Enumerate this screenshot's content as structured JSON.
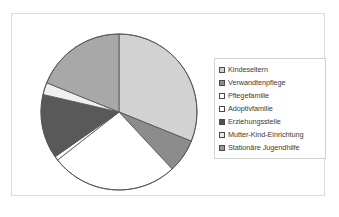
{
  "chart_data": {
    "type": "pie",
    "title": "",
    "legend_position": "right",
    "start_angle_deg": 0,
    "direction": "clockwise",
    "categories": [
      "Kindeseltern",
      "Verwandtenpflege",
      "Pflegefamilie",
      "Adoptivfamilie",
      "Erziehungsstelle",
      "Mutter-Kind-Einrichtung",
      "Stationäre Jugendhilfe"
    ],
    "values": [
      31.1,
      6.9,
      26.4,
      0.8,
      13.3,
      2.5,
      18.9
    ],
    "colors": [
      "#d2d2d2",
      "#8c8c8c",
      "#ffffff",
      "#ffffff",
      "#595959",
      "#f0f0f0",
      "#a8a8a8"
    ],
    "slices": [
      {
        "label": "Kindeseltern",
        "value": 31.1,
        "start_deg": 0.0,
        "end_deg": 112.0,
        "color": "#d2d2d2",
        "swatch": "#d2d2d2"
      },
      {
        "label": "Verwandtenpflege",
        "value": 6.9,
        "start_deg": 112.0,
        "end_deg": 137.0,
        "color": "#8c8c8c",
        "swatch": "#8c8c8c"
      },
      {
        "label": "Pflegefamilie",
        "value": 26.4,
        "start_deg": 137.0,
        "end_deg": 232.0,
        "color": "#ffffff",
        "swatch": "#ffffff"
      },
      {
        "label": "Adoptivfamilie",
        "value": 0.8,
        "start_deg": 232.0,
        "end_deg": 235.0,
        "color": "#ffffff",
        "swatch": "#ffffff"
      },
      {
        "label": "Erziehungsstelle",
        "value": 13.3,
        "start_deg": 235.0,
        "end_deg": 283.0,
        "color": "#595959",
        "swatch": "#4f4f4f"
      },
      {
        "label": "Mutter-Kind-Einrichtung",
        "value": 2.5,
        "start_deg": 283.0,
        "end_deg": 292.0,
        "color": "#f0f0f0",
        "swatch": "#e8e8e8"
      },
      {
        "label": "Stationäre Jugendhilfe",
        "value": 18.9,
        "start_deg": 292.0,
        "end_deg": 360.0,
        "color": "#a8a8a8",
        "swatch": "#9a9a9a"
      }
    ],
    "outline_color": "#555555",
    "frame_color": "#dcdcdc",
    "background": "#ffffff"
  },
  "legend": {
    "items": [
      {
        "label": "Kindeseltern"
      },
      {
        "label": "Verwandtenpflege"
      },
      {
        "label": "Pflegefamilie"
      },
      {
        "label": "Adoptivfamilie"
      },
      {
        "label": "Erziehungsstelle"
      },
      {
        "label": "Mutter-Kind-Einrichtung"
      },
      {
        "label": "Stationäre Jugendhilfe"
      }
    ]
  }
}
